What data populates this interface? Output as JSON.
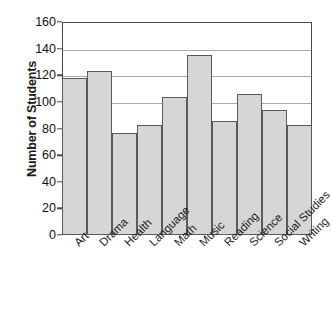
{
  "chart_data": {
    "type": "bar",
    "title": "",
    "xlabel": "",
    "ylabel": "Number of Students",
    "categories": [
      "Art",
      "Drama",
      "Health",
      "Language",
      "Math",
      "Music",
      "Reading",
      "Science",
      "Social Studies",
      "Writing"
    ],
    "values": [
      118,
      123,
      77,
      83,
      104,
      135,
      86,
      106,
      94,
      83
    ],
    "ylim": [
      0,
      160
    ],
    "ytick_values": [
      0,
      20,
      40,
      60,
      80,
      100,
      120,
      140,
      160
    ],
    "ytick_labels": [
      "0",
      "20",
      "40",
      "60",
      "80",
      "100",
      "120",
      "140",
      "160"
    ],
    "gridlines_at": [
      100,
      120,
      140,
      160
    ],
    "grid": true,
    "legend": null,
    "bar_fill_color": "#d6d6d6",
    "bar_edge_color": "#5a5a5a",
    "axis_color": "#4a4a4a",
    "grid_color": "#a8a8a8",
    "label_rotation": -45
  }
}
